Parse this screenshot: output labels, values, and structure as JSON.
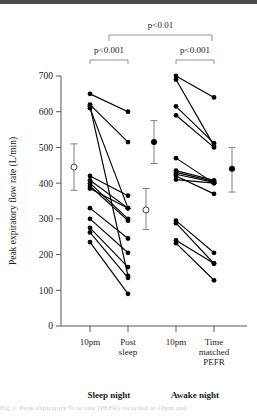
{
  "chart_data": {
    "type": "line",
    "title": "",
    "ylabel": "Peak expiratory flow rate (L/min)",
    "xlabel": "",
    "ylim": [
      0,
      700
    ],
    "ytick_values": [
      0,
      100,
      200,
      300,
      400,
      500,
      600,
      700
    ],
    "ytick_labels": [
      "0",
      "100",
      "200",
      "300",
      "400",
      "500",
      "600",
      "700"
    ],
    "grid": false,
    "legend": "none",
    "categories": [
      "10pm",
      "Post sleep",
      "10pm",
      "Time matched PEFR"
    ],
    "category_labels": [
      [
        "10pm"
      ],
      [
        "Post",
        "sleep"
      ],
      [
        "10pm"
      ],
      [
        "Time",
        "matched",
        "PEFR"
      ]
    ],
    "groups": [
      {
        "name": "Sleep night",
        "categories": [
          "10pm",
          "Post sleep"
        ]
      },
      {
        "name": "Awake night",
        "categories": [
          "10pm",
          "Time matched PEFR"
        ]
      }
    ],
    "paired_series": [
      {
        "group": "Sleep night",
        "note": "paired subject lines from 10pm to Post sleep",
        "pairs": [
          {
            "x1": "10pm",
            "y1": 650,
            "x2": "Post sleep",
            "y2": 600
          },
          {
            "x1": "10pm",
            "y1": 620,
            "x2": "Post sleep",
            "y2": 515
          },
          {
            "x1": "10pm",
            "y1": 615,
            "x2": "Post sleep",
            "y2": 140
          },
          {
            "x1": "10pm",
            "y1": 610,
            "x2": "Post sleep",
            "y2": 330
          },
          {
            "x1": "10pm",
            "y1": 420,
            "x2": "Post sleep",
            "y2": 365
          },
          {
            "x1": "10pm",
            "y1": 408,
            "x2": "Post sleep",
            "y2": 330
          },
          {
            "x1": "10pm",
            "y1": 400,
            "x2": "Post sleep",
            "y2": 300
          },
          {
            "x1": "10pm",
            "y1": 392,
            "x2": "Post sleep",
            "y2": 295
          },
          {
            "x1": "10pm",
            "y1": 385,
            "x2": "Post sleep",
            "y2": 330
          },
          {
            "x1": "10pm",
            "y1": 330,
            "x2": "Post sleep",
            "y2": 245
          },
          {
            "x1": "10pm",
            "y1": 300,
            "x2": "Post sleep",
            "y2": 205
          },
          {
            "x1": "10pm",
            "y1": 275,
            "x2": "Post sleep",
            "y2": 165
          },
          {
            "x1": "10pm",
            "y1": 262,
            "x2": "Post sleep",
            "y2": 135
          },
          {
            "x1": "10pm",
            "y1": 235,
            "x2": "Post sleep",
            "y2": 90
          }
        ]
      },
      {
        "group": "Awake night",
        "note": "paired subject lines from 10pm to Time matched PEFR",
        "pairs": [
          {
            "x1": "10pm",
            "y1": 700,
            "x2": "Time matched PEFR",
            "y2": 640
          },
          {
            "x1": "10pm",
            "y1": 690,
            "x2": "Time matched PEFR",
            "y2": 505
          },
          {
            "x1": "10pm",
            "y1": 615,
            "x2": "Time matched PEFR",
            "y2": 512
          },
          {
            "x1": "10pm",
            "y1": 590,
            "x2": "Time matched PEFR",
            "y2": 500
          },
          {
            "x1": "10pm",
            "y1": 470,
            "x2": "Time matched PEFR",
            "y2": 400
          },
          {
            "x1": "10pm",
            "y1": 435,
            "x2": "Time matched PEFR",
            "y2": 408
          },
          {
            "x1": "10pm",
            "y1": 430,
            "x2": "Time matched PEFR",
            "y2": 405
          },
          {
            "x1": "10pm",
            "y1": 425,
            "x2": "Time matched PEFR",
            "y2": 402
          },
          {
            "x1": "10pm",
            "y1": 420,
            "x2": "Time matched PEFR",
            "y2": 370
          },
          {
            "x1": "10pm",
            "y1": 410,
            "x2": "Time matched PEFR",
            "y2": 400
          },
          {
            "x1": "10pm",
            "y1": 295,
            "x2": "Time matched PEFR",
            "y2": 205
          },
          {
            "x1": "10pm",
            "y1": 288,
            "x2": "Time matched PEFR",
            "y2": 175
          },
          {
            "x1": "10pm",
            "y1": 240,
            "x2": "Time matched PEFR",
            "y2": 175
          },
          {
            "x1": "10pm",
            "y1": 232,
            "x2": "Time matched PEFR",
            "y2": 128
          }
        ]
      }
    ],
    "summary_markers": [
      {
        "category": "10pm",
        "group": "Sleep night",
        "marker": "open-circle",
        "mean": 445,
        "low": 380,
        "high": 510
      },
      {
        "category": "Post sleep",
        "group": "Sleep night",
        "marker": "open-circle",
        "mean": 325,
        "low": 270,
        "high": 385
      },
      {
        "category": "10pm",
        "group": "Awake night",
        "marker": "filled-circle",
        "mean": 515,
        "low": 455,
        "high": 575
      },
      {
        "category": "Time matched PEFR",
        "group": "Awake night",
        "marker": "filled-circle",
        "mean": 440,
        "low": 375,
        "high": 500
      }
    ],
    "annotations": [
      {
        "id": "p-sleep",
        "text": "p<0.001",
        "spans": [
          "10pm (sleep)",
          "Post sleep"
        ]
      },
      {
        "id": "p-awake",
        "text": "p<0.001",
        "spans": [
          "10pm (awake)",
          "Time matched PEFR"
        ]
      },
      {
        "id": "p-between",
        "text": "p<0.01",
        "spans": [
          "Sleep night",
          "Awake night"
        ]
      }
    ]
  },
  "caption": {
    "text": "Fig 1. Peak expiratory flow rate (PEFR) recorded at 10pm and"
  },
  "colors": {
    "point": "#000000",
    "line": "#000000",
    "axis": "#555555",
    "errorbar": "#808080",
    "bracket": "#888888",
    "text": "#1a1a1a"
  }
}
